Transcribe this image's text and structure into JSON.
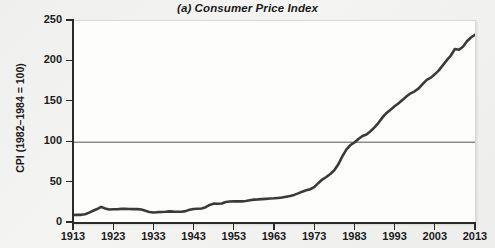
{
  "chart_data": {
    "type": "line",
    "title": "(a) Consumer Price Index",
    "xlabel": "",
    "ylabel": "CPI (1982–1984 = 100)",
    "xlim": [
      1913,
      2013
    ],
    "ylim": [
      0,
      250
    ],
    "yticks": [
      0,
      50,
      100,
      150,
      200,
      250
    ],
    "ytick_labels": [
      "0",
      "50",
      "100",
      "150",
      "200",
      "250"
    ],
    "xticks": [
      1913,
      1923,
      1933,
      1943,
      1953,
      1963,
      1973,
      1983,
      1993,
      2003,
      2013
    ],
    "xtick_labels": [
      "1913",
      "1923",
      "1933",
      "1943",
      "1953",
      "1963",
      "1973",
      "1983",
      "1993",
      "2003",
      "2013"
    ],
    "grid": false,
    "legend": "none",
    "reference_lines": [
      {
        "name": "base-period-100",
        "axis": "y",
        "value": 100,
        "color": "#555555"
      }
    ],
    "series": [
      {
        "name": "Consumer Price Index",
        "color": "#3a3a3a",
        "x": [
          1913,
          1914,
          1915,
          1916,
          1917,
          1918,
          1919,
          1920,
          1921,
          1922,
          1923,
          1924,
          1925,
          1926,
          1927,
          1928,
          1929,
          1930,
          1931,
          1932,
          1933,
          1934,
          1935,
          1936,
          1937,
          1938,
          1939,
          1940,
          1941,
          1942,
          1943,
          1944,
          1945,
          1946,
          1947,
          1948,
          1949,
          1950,
          1951,
          1952,
          1953,
          1954,
          1955,
          1956,
          1957,
          1958,
          1959,
          1960,
          1961,
          1962,
          1963,
          1964,
          1965,
          1966,
          1967,
          1968,
          1969,
          1970,
          1971,
          1972,
          1973,
          1974,
          1975,
          1976,
          1977,
          1978,
          1979,
          1980,
          1981,
          1982,
          1983,
          1984,
          1985,
          1986,
          1987,
          1988,
          1989,
          1990,
          1991,
          1992,
          1993,
          1994,
          1995,
          1996,
          1997,
          1998,
          1999,
          2000,
          2001,
          2002,
          2003,
          2004,
          2005,
          2006,
          2007,
          2008,
          2009,
          2010,
          2011,
          2012,
          2013
        ],
        "y": [
          9.9,
          10.0,
          10.1,
          10.9,
          12.8,
          15.1,
          17.3,
          20.0,
          17.9,
          16.8,
          17.1,
          17.1,
          17.5,
          17.7,
          17.4,
          17.2,
          17.2,
          16.7,
          15.2,
          13.6,
          12.9,
          13.4,
          13.7,
          13.9,
          14.4,
          14.1,
          13.9,
          14.0,
          14.7,
          16.3,
          17.3,
          17.6,
          18.0,
          19.5,
          22.3,
          24.0,
          23.8,
          24.1,
          26.0,
          26.6,
          26.8,
          26.9,
          26.8,
          27.2,
          28.1,
          28.9,
          29.2,
          29.6,
          29.9,
          30.3,
          30.6,
          31.0,
          31.5,
          32.5,
          33.4,
          34.8,
          36.7,
          38.8,
          40.5,
          41.8,
          44.4,
          49.3,
          53.8,
          56.9,
          60.6,
          65.2,
          72.6,
          82.4,
          90.9,
          96.5,
          99.6,
          103.9,
          107.6,
          109.6,
          113.6,
          118.3,
          124.0,
          130.7,
          136.2,
          140.3,
          144.5,
          148.2,
          152.4,
          156.9,
          160.5,
          163.0,
          166.6,
          172.2,
          177.1,
          179.9,
          184.0,
          188.9,
          195.3,
          201.6,
          207.3,
          215.3,
          214.5,
          218.1,
          224.9,
          229.6,
          233.0
        ]
      }
    ]
  }
}
